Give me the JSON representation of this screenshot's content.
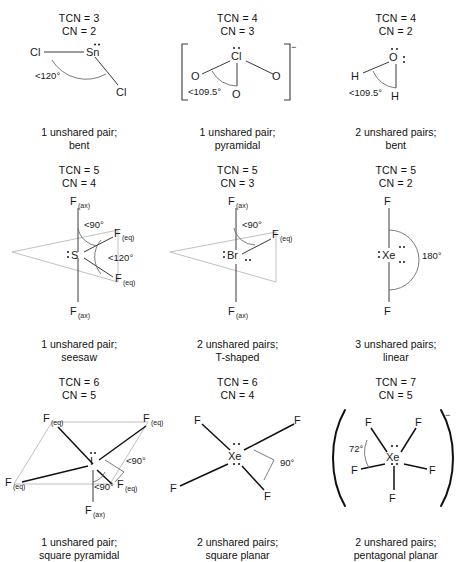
{
  "figure": {
    "type": "vsepr-geometry-chart",
    "rows": 3,
    "columns": 3
  },
  "colors": {
    "ink": "#1a1a1a",
    "bond": "#3b3b3b",
    "faint_plane": "#b9b9b9",
    "arc": "#6d6d6d",
    "background": "#ffffff"
  },
  "cells": [
    {
      "id": "sncl2",
      "tcn": "TCN = 3",
      "cn": "CN = 2",
      "center_atom": "Sn",
      "ligands": [
        "Cl",
        "Cl"
      ],
      "angle_labels": [
        "<120°"
      ],
      "unshared_pairs_text": "1 unshared pair;",
      "shape_name": "bent",
      "lone_pairs": 1,
      "charge": ""
    },
    {
      "id": "clo3",
      "tcn": "TCN = 4",
      "cn": "CN = 3",
      "center_atom": "Cl",
      "ligands": [
        "O",
        "O",
        "O"
      ],
      "angle_labels": [
        "<109.5°"
      ],
      "unshared_pairs_text": "1 unshared pair;",
      "shape_name": "pyramidal",
      "lone_pairs": 1,
      "charge": "−",
      "brackets": true
    },
    {
      "id": "h2o",
      "tcn": "TCN = 4",
      "cn": "CN = 2",
      "center_atom": "O",
      "ligands": [
        "H",
        "H"
      ],
      "angle_labels": [
        "<109.5°"
      ],
      "unshared_pairs_text": "2 unshared pairs;",
      "shape_name": "bent",
      "lone_pairs": 2,
      "charge": ""
    },
    {
      "id": "sf4",
      "tcn": "TCN = 5",
      "cn": "CN = 4",
      "center_atom": "S",
      "ligand_ax_top": "F",
      "ligand_ax_top_sub": "(ax)",
      "ligand_ax_bottom": "F",
      "ligand_ax_bottom_sub": "(ax)",
      "ligand_eq_upper": "F",
      "ligand_eq_upper_sub": "(eq)",
      "ligand_eq_lower": "F",
      "ligand_eq_lower_sub": "(eq)",
      "angle_labels": [
        "<90°",
        "<120°"
      ],
      "unshared_pairs_text": "1 unshared pair;",
      "shape_name": "seesaw",
      "lone_pairs": 1,
      "charge": ""
    },
    {
      "id": "brf3",
      "tcn": "TCN = 5",
      "cn": "CN = 3",
      "center_atom": "Br",
      "ligand_ax_top": "F",
      "ligand_ax_top_sub": "(ax)",
      "ligand_ax_bottom": "F",
      "ligand_ax_bottom_sub": "(ax)",
      "ligand_eq_upper": "F",
      "ligand_eq_upper_sub": "(eq)",
      "angle_labels": [
        "<90°"
      ],
      "unshared_pairs_text": "2 unshared pairs;",
      "shape_name": "T-shaped",
      "lone_pairs": 2,
      "charge": ""
    },
    {
      "id": "xef2",
      "tcn": "TCN = 5",
      "cn": "CN = 2",
      "center_atom": "Xe",
      "ligands": [
        "F",
        "F"
      ],
      "angle_labels": [
        "180°"
      ],
      "unshared_pairs_text": "3 unshared pairs;",
      "shape_name": "linear",
      "lone_pairs": 3,
      "charge": ""
    },
    {
      "id": "if5",
      "tcn": "TCN = 6",
      "cn": "CN = 5",
      "center_atom": "I",
      "ligand_eq_labels": [
        "F",
        "F",
        "F",
        "F"
      ],
      "ligand_eq_sub": "(eq)",
      "ligand_ax_label": "F",
      "ligand_ax_sub": "(ax)",
      "angle_labels": [
        "<90°",
        "<90°"
      ],
      "unshared_pairs_text": "1 unshared pair;",
      "shape_name": "square pyramidal",
      "lone_pairs": 1,
      "charge": ""
    },
    {
      "id": "xef4",
      "tcn": "TCN = 6",
      "cn": "CN = 4",
      "center_atom": "Xe",
      "ligands": [
        "F",
        "F",
        "F",
        "F"
      ],
      "angle_labels": [
        "90°"
      ],
      "unshared_pairs_text": "2 unshared pairs;",
      "shape_name": "square planar",
      "lone_pairs": 2,
      "charge": ""
    },
    {
      "id": "xef5",
      "tcn": "TCN = 7",
      "cn": "CN = 5",
      "center_atom": "Xe",
      "ligands": [
        "F",
        "F",
        "F",
        "F",
        "F"
      ],
      "angle_labels": [
        "72°"
      ],
      "unshared_pairs_text": "2 unshared pairs;",
      "shape_name": "pentagonal planar",
      "lone_pairs": 2,
      "charge": "−",
      "parentheses": true
    }
  ]
}
